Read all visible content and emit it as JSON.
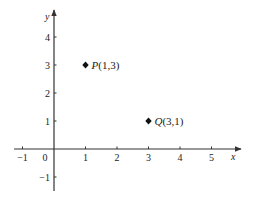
{
  "chart_data": {
    "type": "scatter",
    "title": "",
    "xlabel": "x",
    "ylabel": "y",
    "xlim": [
      -1.2,
      5.9
    ],
    "ylim": [
      -1.4,
      4.9
    ],
    "x_ticks": [
      -1,
      1,
      2,
      3,
      4,
      5
    ],
    "y_ticks": [
      -1,
      1,
      2,
      3,
      4
    ],
    "origin_label": "0",
    "grid": false,
    "legend": null,
    "marker": "diamond",
    "points": [
      {
        "name": "P",
        "x": 1,
        "y": 3,
        "label": "(1,3)"
      },
      {
        "name": "Q",
        "x": 3,
        "y": 1,
        "label": "(3,1)"
      }
    ]
  },
  "colors": {
    "axis": "#333333",
    "marker": "#111111",
    "text": "#222222"
  }
}
